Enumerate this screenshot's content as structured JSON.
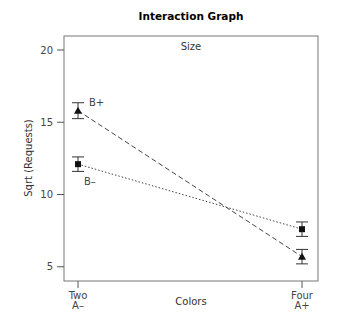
{
  "chart_data": {
    "type": "line",
    "title": "Interaction Graph",
    "legend_title": "Size",
    "xlabel": "Colors",
    "ylabel": "Sqrt (Requests)",
    "categories": [
      "Two\nA–",
      "Four\nA+"
    ],
    "category_lines": [
      [
        "Two",
        "A–"
      ],
      [
        "Four",
        "A+"
      ]
    ],
    "ylim": [
      4,
      21
    ],
    "yticks": [
      5,
      10,
      15,
      20
    ],
    "grid": false,
    "series": [
      {
        "name": "B+",
        "marker": "triangle",
        "linestyle": "dashed",
        "values": [
          15.8,
          5.7
        ],
        "error": [
          0.55,
          0.5
        ]
      },
      {
        "name": "B–",
        "marker": "square",
        "linestyle": "dotted",
        "values": [
          12.1,
          7.6
        ],
        "error": [
          0.5,
          0.5
        ]
      }
    ]
  }
}
